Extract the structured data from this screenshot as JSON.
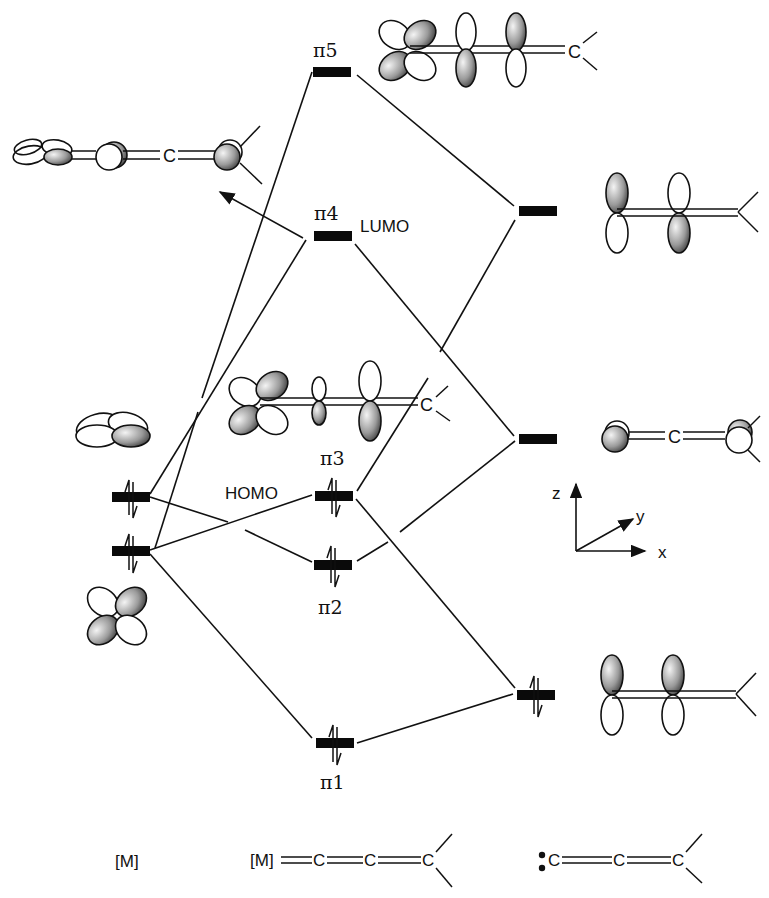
{
  "fragments": {
    "left": {
      "label": "[M]",
      "description": "metal d orbitals"
    },
    "center": {
      "label": "[M]=C=C=C<",
      "description": "metal-allenylidene complex"
    },
    "right": {
      "label": ":C=C=C<",
      "description": "allenylidene ligand (free carbene)"
    }
  },
  "axes": {
    "z": "z",
    "y": "y",
    "x": "x"
  },
  "levels": {
    "metal": [
      {
        "id": "d_upper",
        "occupancy": 2,
        "orbital": "d (in-plane, xz-type)"
      },
      {
        "id": "d_lower",
        "occupancy": 2,
        "orbital": "d (xz, four-lobed)"
      }
    ],
    "complex": [
      {
        "id": "pi5",
        "label": "π5",
        "occupancy": 0,
        "tag": ""
      },
      {
        "id": "pi4",
        "label": "π4",
        "occupancy": 0,
        "tag": "LUMO"
      },
      {
        "id": "pi3",
        "label": "π3",
        "occupancy": 2,
        "tag": "HOMO"
      },
      {
        "id": "pi2",
        "label": "π2",
        "occupancy": 2,
        "tag": ""
      },
      {
        "id": "pi1",
        "label": "π1",
        "occupancy": 2,
        "tag": ""
      }
    ],
    "ligand": [
      {
        "id": "lig_upper",
        "occupancy": 0,
        "orbital": "π* (p-z, alternating)"
      },
      {
        "id": "lig_mid",
        "occupancy": 0,
        "orbital": "p-y out-of-plane"
      },
      {
        "id": "lig_lower",
        "occupancy": 2,
        "orbital": "π (p-z, in-phase)"
      }
    ]
  },
  "labels": {
    "pi5": "π5",
    "pi4": "π4",
    "pi3": "π3",
    "pi2": "π2",
    "pi1": "π1",
    "lumo": "LUMO",
    "homo": "HOMO",
    "atom_c": "C",
    "axis_z": "z",
    "axis_y": "y",
    "axis_x": "x",
    "bottom_metal": "[M]",
    "bottom_complex_m": "[M]",
    "bottom_complex_c1": "C",
    "bottom_complex_c2": "C",
    "bottom_complex_c3": "C",
    "bottom_ligand_c1": "C",
    "bottom_ligand_c2": "C",
    "bottom_ligand_c3": "C"
  },
  "colors": {
    "ink": "#111111",
    "background": "#ffffff",
    "lobe_shade_light": "#f2f2f2",
    "lobe_shade_dark": "#555555"
  }
}
